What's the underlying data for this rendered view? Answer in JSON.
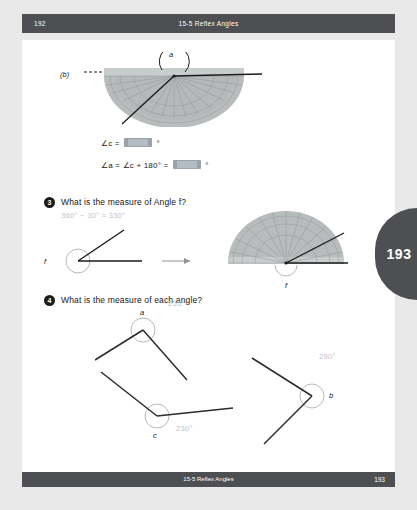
{
  "runhead": {
    "page_number": "192",
    "title": "15-5  Reflex Angles"
  },
  "footer": {
    "title": "15-5  Reflex Angles",
    "page_number": "193"
  },
  "side_tab": {
    "page_number": "193"
  },
  "figure_b": {
    "label": "(b)",
    "angle_label": "a"
  },
  "equations": {
    "line1_prefix": "∠c =",
    "line1_suffix": "°",
    "line2_prefix": "∠a = ∠c + 180° =",
    "line2_suffix": "°"
  },
  "question3": {
    "number": "3",
    "text": "What is the measure of Angle f?",
    "answer": "360° − 30° = 330°",
    "angle_label_left": "f",
    "angle_label_protractor": "f"
  },
  "question4": {
    "number": "4",
    "text": "What is the measure of each angle?",
    "angles": [
      {
        "label": "a",
        "answer": "255°"
      },
      {
        "label": "b",
        "answer": "290°"
      },
      {
        "label": "c",
        "answer": "230°"
      }
    ]
  },
  "colors": {
    "bar": "#4d4f52",
    "answer_text": "#c3ccd2",
    "protractor_fill": "#b9bcbd",
    "page_bg": "#e9e9e9"
  }
}
